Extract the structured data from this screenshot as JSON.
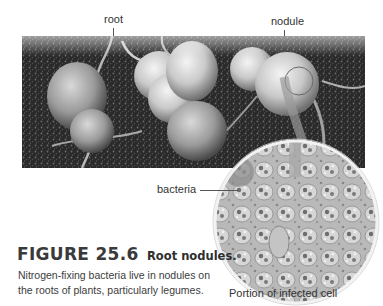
{
  "figure": {
    "number_label": "FIGURE 25.6",
    "title": "Root nodules.",
    "body_lines": [
      "Nitrogen-fixing bacteria live in nodules on",
      "the roots of plants, particularly legumes."
    ]
  },
  "photo": {
    "subject": "legume roots with nodules in soil",
    "callouts": {
      "root": "root",
      "nodule": "nodule"
    }
  },
  "micrograph": {
    "callouts": {
      "bacteria": "bacteria"
    },
    "caption": "Portion of infected cell"
  },
  "colors": {
    "background": "#ffffff",
    "text": "#333333",
    "leader_lines": "#555555",
    "micrograph_rim": "#f2f2f2"
  }
}
